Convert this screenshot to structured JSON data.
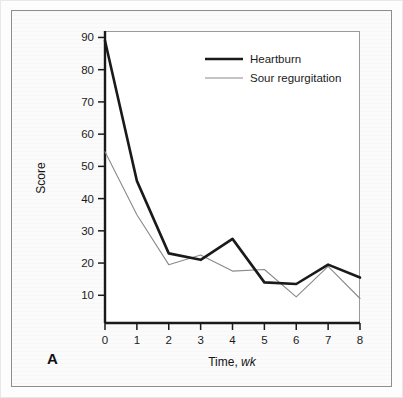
{
  "figure": {
    "panel_label": "A",
    "frame_color": "#8e8e8e",
    "background_color": "#fbfbfb",
    "plot_background_color": "#ffffff"
  },
  "legend": {
    "position": "top-right",
    "entries": [
      {
        "label": "Heartburn",
        "color": "#1a1a1a",
        "line_width": "2.6"
      },
      {
        "label": "Sour regurgitation",
        "color": "#8a8a8a",
        "line_width": "1.1"
      }
    ]
  },
  "axes": {
    "y_title": "Score",
    "x_title_main": "Time, ",
    "x_title_unit": "wk",
    "y_ticks": [
      "10",
      "20",
      "30",
      "40",
      "50",
      "60",
      "70",
      "80",
      "90"
    ],
    "x_ticks": [
      "0",
      "1",
      "2",
      "3",
      "4",
      "5",
      "6",
      "7",
      "8"
    ]
  },
  "chart_data": {
    "type": "line",
    "title": "",
    "subtitle": "",
    "xlabel": "Time, wk",
    "ylabel": "Score",
    "x": [
      0,
      1,
      2,
      3,
      4,
      5,
      6,
      7,
      8
    ],
    "xlim": [
      0,
      8
    ],
    "ylim": [
      1.4,
      92
    ],
    "xticks": [
      0,
      1,
      2,
      3,
      4,
      5,
      6,
      7,
      8
    ],
    "yticks": [
      10,
      20,
      30,
      40,
      50,
      60,
      70,
      80,
      90
    ],
    "grid": false,
    "legend_position": "upper right",
    "annotations": [
      "A"
    ],
    "series": [
      {
        "name": "Heartburn",
        "color": "#1a1a1a",
        "line_width": 2.6,
        "values": [
          89,
          45.5,
          23,
          21,
          27.5,
          14,
          13.5,
          19.5,
          15.5
        ]
      },
      {
        "name": "Sour regurgitation",
        "color": "#8a8a8a",
        "line_width": 1.1,
        "values": [
          54.5,
          35,
          19.5,
          22.5,
          17.5,
          18,
          9.5,
          19,
          9
        ]
      }
    ]
  }
}
